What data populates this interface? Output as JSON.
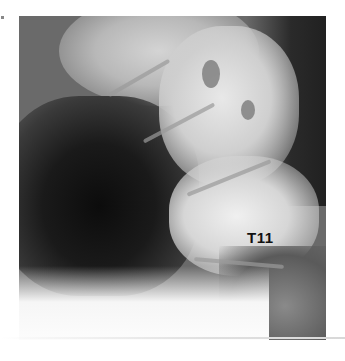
{
  "image": {
    "subject": "lateral spine radiograph",
    "label": "T11"
  }
}
